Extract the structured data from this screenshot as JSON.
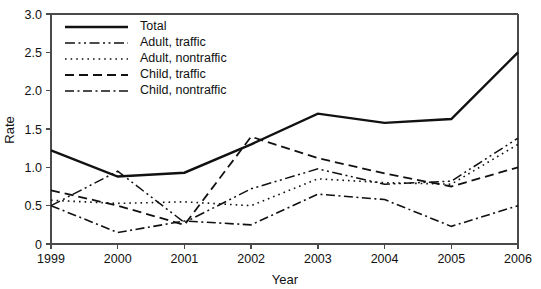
{
  "chart_data": {
    "type": "line",
    "title": "",
    "xlabel": "Year",
    "ylabel": "Rate",
    "x": [
      1999,
      2000,
      2001,
      2002,
      2003,
      2004,
      2005,
      2006
    ],
    "xtick_labels": [
      "1999",
      "2000",
      "2001",
      "2002",
      "2003",
      "2004",
      "2005",
      "2006"
    ],
    "ytick_labels": [
      "0",
      "0.5",
      "1.0",
      "1.5",
      "2.0",
      "2.5",
      "3.0"
    ],
    "ytick_values": [
      0,
      0.5,
      1.0,
      1.5,
      2.0,
      2.5,
      3.0
    ],
    "ylim": [
      0,
      3.0
    ],
    "xlim": [
      1999,
      2006
    ],
    "grid": false,
    "legend_position": "top-left",
    "series": [
      {
        "name": "Total",
        "dash": "solid",
        "width": 2.4,
        "values": [
          1.22,
          0.88,
          0.93,
          1.3,
          1.7,
          1.58,
          1.63,
          2.5
        ]
      },
      {
        "name": "Adult, traffic",
        "dash": "dash-dot-dot",
        "width": 1.5,
        "values": [
          0.5,
          0.95,
          0.28,
          0.72,
          0.98,
          0.78,
          0.82,
          1.38
        ]
      },
      {
        "name": "Adult, nontraffic",
        "dash": "dotted",
        "width": 1.6,
        "values": [
          0.57,
          0.53,
          0.55,
          0.5,
          0.85,
          0.8,
          0.78,
          1.3
        ]
      },
      {
        "name": "Child, traffic",
        "dash": "dashed",
        "width": 1.8,
        "values": [
          0.7,
          0.5,
          0.25,
          1.4,
          1.12,
          0.92,
          0.75,
          1.0
        ]
      },
      {
        "name": "Child, nontraffic",
        "dash": "dash-dot",
        "width": 1.6,
        "values": [
          0.5,
          0.15,
          0.3,
          0.25,
          0.65,
          0.58,
          0.23,
          0.5
        ]
      }
    ]
  },
  "legend": {
    "items": [
      {
        "label": "Total"
      },
      {
        "label": "Adult, traffic"
      },
      {
        "label": "Adult, nontraffic"
      },
      {
        "label": "Child, traffic"
      },
      {
        "label": "Child, nontraffic"
      }
    ]
  }
}
